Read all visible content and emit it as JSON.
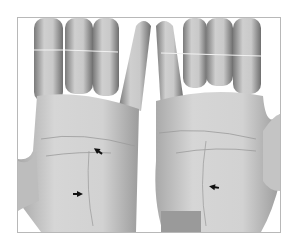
{
  "figure": {
    "colors": {
      "background": "#ffffff",
      "border": "#b8b8b8",
      "skin": "#d4d4d4",
      "arrow": "#111111"
    },
    "arrows": [
      {
        "hand": "left",
        "x": 97,
        "y": 150
      },
      {
        "hand": "left",
        "x": 76,
        "y": 193
      },
      {
        "hand": "right",
        "x": 213,
        "y": 186
      }
    ]
  }
}
